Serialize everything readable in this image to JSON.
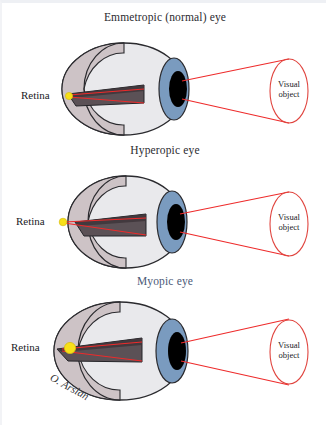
{
  "figure": {
    "signature": "O. Arslan",
    "background_color": "#ffffff"
  },
  "colors": {
    "sclera": "#e9e9ec",
    "sclera_outline": "#2a2a2e",
    "interior_cutaway": "#cdc3c6",
    "interior_shadow": "#b9aeb2",
    "wedge_dark": "#5b5156",
    "wedge_darker": "#3e3539",
    "iris": "#7a9bbf",
    "pupil": "#000000",
    "light_ray": "#ee2b2b",
    "focal_point": "#f7e018",
    "title_text": "#2b2b2f",
    "myopic_title_text": "#4a5a78"
  },
  "panels": [
    {
      "id": "emmetropic",
      "title": "Emmetropic (normal) eye",
      "title_color": "#2b2b2f",
      "retina_label": "Retina",
      "visual_object_label_line1": "Visual",
      "visual_object_label_line2": "object",
      "focal_point_position": "on-retina",
      "focal_point_size": "small"
    },
    {
      "id": "hyperopic",
      "title": "Hyperopic eye",
      "title_color": "#2b2b2f",
      "retina_label": "Retina",
      "visual_object_label_line1": "Visual",
      "visual_object_label_line2": "object",
      "focal_point_position": "behind-retina",
      "focal_point_size": "small"
    },
    {
      "id": "myopic",
      "title": "Myopic eye",
      "title_color": "#4a5a78",
      "retina_label": "Retina",
      "visual_object_label_line1": "Visual",
      "visual_object_label_line2": "object",
      "focal_point_position": "in-front-of-retina",
      "focal_point_size": "large"
    }
  ]
}
